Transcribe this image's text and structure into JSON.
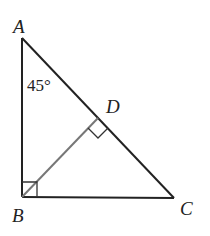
{
  "diagram": {
    "type": "geometry",
    "points": {
      "A": {
        "label": "A",
        "x": 22,
        "y": 38
      },
      "B": {
        "label": "B",
        "x": 22,
        "y": 197
      },
      "C": {
        "label": "C",
        "x": 174,
        "y": 198
      },
      "D": {
        "label": "D",
        "x": 98,
        "y": 118
      }
    },
    "angle_label": "45°",
    "segments": [
      "AB",
      "BC",
      "CA",
      "BD"
    ],
    "right_angles": [
      "B",
      "D"
    ],
    "colors": {
      "stroke": "#222222",
      "altitude": "#777777"
    }
  }
}
